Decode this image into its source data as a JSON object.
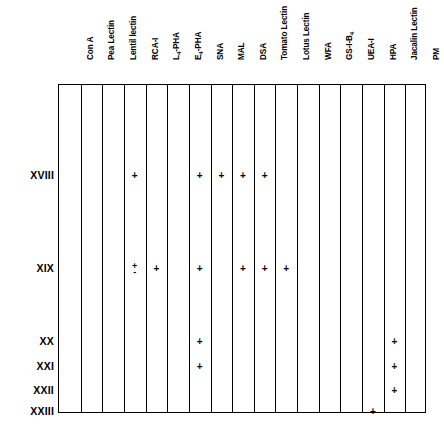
{
  "table": {
    "columns": [
      {
        "id": "con-a",
        "label": "Con A",
        "sub": null
      },
      {
        "id": "pea-lectin",
        "label": "Pea Lectin",
        "sub": null
      },
      {
        "id": "lentil-lectin",
        "label": "Lentil lectin",
        "sub": null
      },
      {
        "id": "rca-i",
        "label": "RCA-I",
        "sub": null
      },
      {
        "id": "l4-pha",
        "label": "L",
        "sub": "4",
        "label_tail": "-PHA"
      },
      {
        "id": "e4-pha",
        "label": "E",
        "sub": "4",
        "label_tail": "-PHA"
      },
      {
        "id": "sna",
        "label": "SNA",
        "sub": null
      },
      {
        "id": "mal",
        "label": "MAL",
        "sub": null
      },
      {
        "id": "dsa",
        "label": "DSA",
        "sub": null
      },
      {
        "id": "tomato-lectin",
        "label": "Tomato Lectin",
        "sub": null
      },
      {
        "id": "lotus-lectin",
        "label": "Lotus Lectin",
        "sub": null
      },
      {
        "id": "wfa",
        "label": "WFA",
        "sub": null
      },
      {
        "id": "gs-i-b4",
        "label": "GS-I-B",
        "sub": "4",
        "label_tail": ""
      },
      {
        "id": "uea-i",
        "label": "UEA-I",
        "sub": null
      },
      {
        "id": "hpa",
        "label": "HPA",
        "sub": null
      },
      {
        "id": "jacalin-lectin",
        "label": "Jacalin Lectin",
        "sub": null
      },
      {
        "id": "pm",
        "label": "PM",
        "sub": null
      }
    ],
    "rows": [
      {
        "id": "row-xviii",
        "label": "XVIII"
      },
      {
        "id": "row-xix",
        "label": "XIX"
      },
      {
        "id": "row-xx",
        "label": "XX"
      },
      {
        "id": "row-xxi",
        "label": "XXI"
      },
      {
        "id": "row-xxii",
        "label": "XXII"
      },
      {
        "id": "row-xxiii",
        "label": "XXIII"
      }
    ],
    "cells": [
      {
        "row": "row-xviii",
        "column": "rca-i",
        "value": "+"
      },
      {
        "row": "row-xviii",
        "column": "sna",
        "value": "+"
      },
      {
        "row": "row-xviii",
        "column": "mal",
        "value": "+"
      },
      {
        "row": "row-xviii",
        "column": "dsa",
        "value": "+"
      },
      {
        "row": "row-xviii",
        "column": "tomato-lectin",
        "value": "+"
      },
      {
        "row": "row-xix",
        "column": "rca-i",
        "value": "+/-"
      },
      {
        "row": "row-xix",
        "column": "l4-pha",
        "value": "+"
      },
      {
        "row": "row-xix",
        "column": "sna",
        "value": "+"
      },
      {
        "row": "row-xix",
        "column": "dsa",
        "value": "+"
      },
      {
        "row": "row-xix",
        "column": "tomato-lectin",
        "value": "+"
      },
      {
        "row": "row-xix",
        "column": "lotus-lectin",
        "value": "+"
      },
      {
        "row": "row-xx",
        "column": "sna",
        "value": "+"
      },
      {
        "row": "row-xx",
        "column": "jacalin-lectin",
        "value": "+"
      },
      {
        "row": "row-xxi",
        "column": "sna",
        "value": "+"
      },
      {
        "row": "row-xxi",
        "column": "jacalin-lectin",
        "value": "+"
      },
      {
        "row": "row-xxii",
        "column": "jacalin-lectin",
        "value": "+"
      },
      {
        "row": "row-xxiii",
        "column": "hpa",
        "value": "+"
      }
    ],
    "symbols": {
      "positive": "+",
      "plus_minus_top": "+",
      "plus_minus_bottom": "-"
    },
    "colors": {
      "grid_line": "#000000",
      "text": "#000000",
      "background": "#ffffff"
    }
  },
  "layout": {
    "grid_left": 58,
    "grid_top": 84,
    "grid_width": 368,
    "grid_height": 329,
    "column_width": 21.647,
    "row_y": {
      "row-xviii": 175,
      "row-xix": 268,
      "row-xx": 341,
      "row-xxi": 366,
      "row-xxii": 390,
      "row-xxiii": 411
    }
  }
}
